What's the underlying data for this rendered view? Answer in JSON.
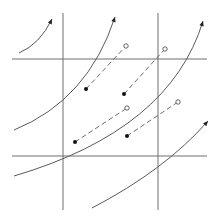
{
  "diagram": {
    "width": 218,
    "height": 222,
    "colors": {
      "grid": "#6e6e6e",
      "curve": "#5a5a5a",
      "dot": "#111111",
      "ring_stroke": "#555555",
      "background": "#ffffff"
    },
    "grid_lines": {
      "horizontal": [
        {
          "y": 59,
          "x1": 12,
          "x2": 207
        },
        {
          "y": 156,
          "x1": 12,
          "x2": 207
        }
      ],
      "vertical": [
        {
          "x": 63,
          "y1": 13,
          "y2": 210
        },
        {
          "x": 158,
          "y1": 13,
          "y2": 210
        }
      ]
    },
    "curves": [
      {
        "id": "curve-1",
        "path": "M19 53 Q40 44 52 19",
        "arrow_at": [
          52,
          19
        ]
      },
      {
        "id": "curve-2",
        "path": "M14 130 Q88 100 115 17",
        "arrow_at": [
          115,
          17
        ]
      },
      {
        "id": "curve-3",
        "path": "M14 176 Q170 130 203 21",
        "arrow_at": [
          203,
          21
        ]
      },
      {
        "id": "curve-4",
        "path": "M92 208 Q165 170 208 121",
        "arrow_at": [
          208,
          121
        ]
      }
    ],
    "dashed_vectors": [
      {
        "from": [
          86,
          89
        ],
        "to": [
          126,
          46
        ]
      },
      {
        "from": [
          124,
          94
        ],
        "to": [
          165,
          49
        ]
      },
      {
        "from": [
          75,
          142
        ],
        "to": [
          127,
          108
        ]
      },
      {
        "from": [
          127,
          136
        ],
        "to": [
          178,
          102
        ]
      }
    ]
  }
}
